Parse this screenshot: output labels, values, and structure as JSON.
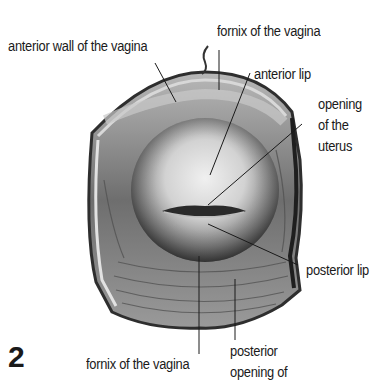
{
  "figure": {
    "number": "2",
    "labels": {
      "anterior_wall": "anterior wall of the vagina",
      "fornix_top": "fornix of the vagina",
      "anterior_lip": "anterior lip",
      "opening_uterus_1": "opening",
      "opening_uterus_2": "of the",
      "opening_uterus_3": "uterus",
      "posterior_lip": "posterior lip",
      "fornix_bottom": "fornix of the vagina",
      "posterior_opening_1": "posterior",
      "posterior_opening_2": "opening of"
    },
    "colors": {
      "background": "#ffffff",
      "text": "#1a1a1a",
      "outer_rim": "#3a3a3a",
      "wall_mid": "#8c8c8c",
      "cervix_light": "#e6e6e6",
      "cervix_dark": "#4a4a4a"
    }
  }
}
